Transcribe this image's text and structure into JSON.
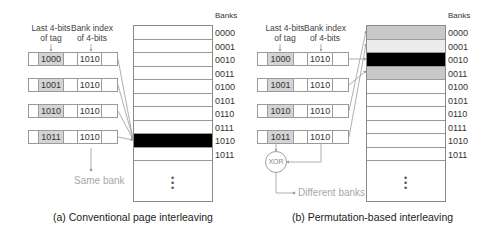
{
  "left": {
    "header_tag": [
      "Last 4-bits",
      "of tag"
    ],
    "header_index": [
      "Bank  index",
      "of 4-bits"
    ],
    "rows": [
      {
        "tag": "1000",
        "index": "1010"
      },
      {
        "tag": "1001",
        "index": "1010"
      },
      {
        "tag": "1010",
        "index": "1010"
      },
      {
        "tag": "1011",
        "index": "1010"
      }
    ],
    "banks_title": "Banks",
    "bank_labels": [
      "0000",
      "0001",
      "0010",
      "0011",
      "0100",
      "0101",
      "0110",
      "0111",
      "1010",
      "1011"
    ],
    "highlighted_bank": "1010",
    "note": "Same bank",
    "caption": "(a) Conventional page interleaving"
  },
  "right": {
    "header_tag": [
      "Last 4-bits",
      "of tag"
    ],
    "header_index": [
      "Bank  index",
      "of 4-bits"
    ],
    "rows": [
      {
        "tag": "1000",
        "index": "1010"
      },
      {
        "tag": "1001",
        "index": "1010"
      },
      {
        "tag": "1010",
        "index": "1010"
      },
      {
        "tag": "1011",
        "index": "1010"
      }
    ],
    "xor_label": "XOR",
    "banks_title": "Banks",
    "bank_labels": [
      "0000",
      "0001",
      "0010",
      "0011",
      "0100",
      "0101",
      "0110",
      "0111",
      "1010",
      "1011"
    ],
    "bank_fills": [
      "#c8c8c8",
      "#ececec",
      "#000000",
      "#c8c8c8",
      "#ffffff",
      "#ffffff",
      "#ffffff",
      "#ffffff",
      "#ffffff",
      "#ffffff"
    ],
    "note": "Different banks",
    "caption": "(b) Permutation-based interleaving"
  },
  "colors": {
    "grey_cell": "#d4d4d4",
    "black_bank": "#000000",
    "grey_bank": "#c8c8c8",
    "light_bank": "#ececec",
    "note_text": "#a8a8a8"
  }
}
